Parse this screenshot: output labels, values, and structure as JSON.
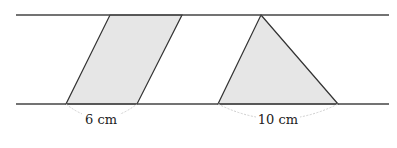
{
  "diagram": {
    "colors": {
      "line": "#333333",
      "fill": "#e6e6e6",
      "arc": "#cccccc"
    },
    "parallel_lines": {
      "top_y": 15,
      "bottom_y": 104,
      "x_start": 16,
      "x_end": 389
    },
    "shapes": [
      {
        "type": "parallelogram",
        "base_label": "6 cm"
      },
      {
        "type": "triangle",
        "base_label": "10 cm"
      }
    ]
  }
}
